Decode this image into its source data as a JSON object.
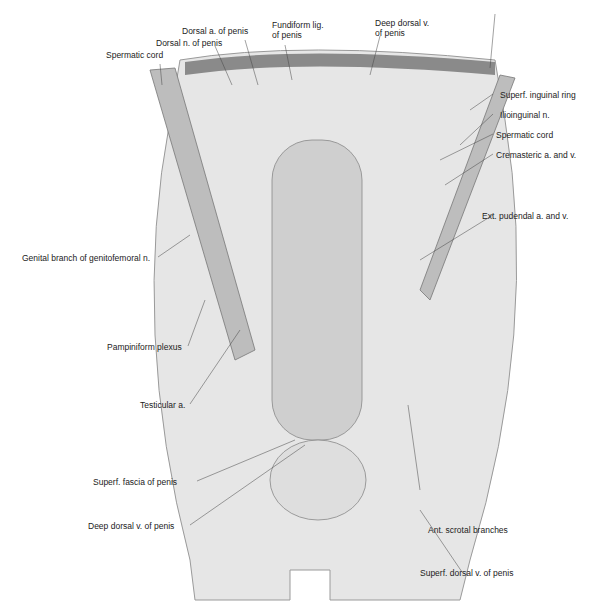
{
  "figure": {
    "labels_top": [
      {
        "id": "spermatic-cord-left",
        "text": "Spermatic cord"
      },
      {
        "id": "dorsal-n",
        "text": "Dorsal n. of penis"
      },
      {
        "id": "dorsal-a",
        "text": "Dorsal a. of penis"
      },
      {
        "id": "fundiform-lig",
        "line1": "Fundiform lig.",
        "line2": "of penis"
      },
      {
        "id": "deep-dorsal-v-top",
        "line1": "Deep dorsal v.",
        "line2": "of penis"
      }
    ],
    "labels_right": [
      {
        "id": "superf-inguinal-ring",
        "text": "Superf. inguinal ring"
      },
      {
        "id": "ilioinguinal-n",
        "text": "Ilioinguinal n."
      },
      {
        "id": "spermatic-cord-right",
        "text": "Spermatic cord"
      },
      {
        "id": "cremasteric",
        "text": "Cremasteric a. and v."
      },
      {
        "id": "ext-pudendal",
        "text": "Ext. pudendal a. and v."
      },
      {
        "id": "ant-scrotal",
        "text": "Ant. scrotal branches"
      },
      {
        "id": "superf-dorsal-v",
        "text": "Superf. dorsal v. of penis"
      }
    ],
    "labels_left": [
      {
        "id": "genital-branch",
        "text": "Genital branch of genitofemoral n."
      },
      {
        "id": "pampiniform",
        "text": "Pampiniform plexus"
      },
      {
        "id": "testicular-a",
        "text": "Testicular a."
      },
      {
        "id": "superf-fascia",
        "text": "Superf. fascia of penis"
      },
      {
        "id": "deep-dorsal-v-bottom",
        "text": "Deep dorsal v. of penis"
      }
    ]
  }
}
